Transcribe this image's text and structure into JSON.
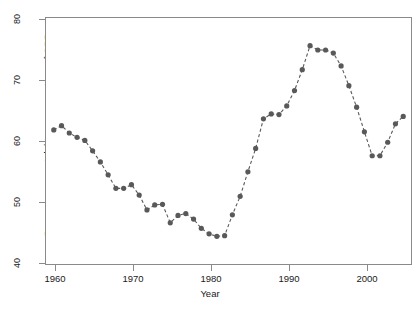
{
  "chart_data": {
    "type": "line",
    "title": "",
    "subtitle": "",
    "xlabel": "Year",
    "ylabel": "Gross government debt as a percentage of GDP",
    "xlim": [
      1959,
      2006
    ],
    "ylim": [
      40,
      80
    ],
    "xticks": [
      1960,
      1970,
      1980,
      1990,
      2000
    ],
    "xtick_labels": [
      "1960",
      "1970",
      "1980",
      "1990",
      "2000"
    ],
    "yticks": [
      40,
      50,
      60,
      70,
      80
    ],
    "ytick_labels": [
      "40",
      "50",
      "60",
      "70",
      "80"
    ],
    "grid": false,
    "legend": "none",
    "marker": "filled-circle",
    "linestyle": "dashed",
    "series_color": "#595959",
    "axis_color": "#8a8a8a",
    "background_color": "#ffffff",
    "x": [
      1960,
      1961,
      1962,
      1963,
      1964,
      1965,
      1966,
      1967,
      1968,
      1969,
      1970,
      1971,
      1972,
      1973,
      1974,
      1975,
      1976,
      1977,
      1978,
      1979,
      1980,
      1981,
      1982,
      1983,
      1984,
      1985,
      1986,
      1987,
      1988,
      1989,
      1990,
      1991,
      1992,
      1993,
      1994,
      1995,
      1996,
      1997,
      1998,
      1999,
      2000,
      2001,
      2002,
      2003,
      2004,
      2005
    ],
    "values": [
      61.8,
      62.5,
      61.3,
      60.6,
      60.1,
      58.4,
      56.6,
      54.5,
      52.3,
      52.3,
      52.9,
      51.2,
      48.8,
      49.6,
      49.7,
      46.7,
      47.9,
      48.2,
      47.3,
      45.8,
      44.9,
      44.5,
      44.6,
      48.0,
      51.0,
      55.0,
      58.8,
      63.6,
      64.4,
      64.3,
      65.7,
      68.2,
      71.6,
      75.5,
      74.8,
      74.8,
      74.3,
      72.2,
      69.0,
      65.5,
      61.5,
      57.6,
      57.6,
      59.8,
      62.8,
      64.0
    ]
  },
  "axes": {
    "xlabel": "Year",
    "ylabel": "Gross government debt as a percentage of GDP"
  }
}
